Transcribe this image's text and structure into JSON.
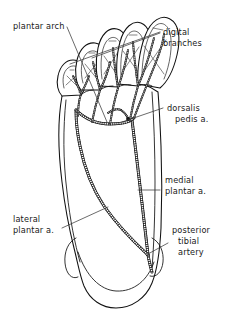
{
  "figure": {
    "view": "plantar view, right foot",
    "background_color": "#ffffff",
    "ink_color": "#111111",
    "label_color": "#1a1a1a",
    "leader_color": "#3a3a3a"
  },
  "labels": {
    "plantar_arch": "plantar arch",
    "digital_branches_line1": "digital",
    "digital_branches_line2": "branches",
    "dorsalis_pedis_line1": "dorsalis",
    "dorsalis_pedis_line2": "pedis a.",
    "medial_plantar_line1": "medial",
    "medial_plantar_line2": "plantar a.",
    "lateral_plantar_line1": "lateral",
    "lateral_plantar_line2": "plantar a.",
    "posterior_tibial_line1": "posterior",
    "posterior_tibial_line2": "tibial",
    "posterior_tibial_line3": "artery"
  },
  "structures": [
    {
      "name": "plantar-arch",
      "label": "plantar arch",
      "kind": "artery"
    },
    {
      "name": "digital-branches",
      "label": "digital branches",
      "kind": "artery"
    },
    {
      "name": "dorsalis-pedis-artery",
      "label": "dorsalis pedis a.",
      "kind": "artery"
    },
    {
      "name": "medial-plantar-artery",
      "label": "medial plantar a.",
      "kind": "artery"
    },
    {
      "name": "lateral-plantar-artery",
      "label": "lateral plantar a.",
      "kind": "artery"
    },
    {
      "name": "posterior-tibial-artery",
      "label": "posterior tibial artery",
      "kind": "artery"
    }
  ],
  "toes": [
    {
      "name": "toe-1-hallux",
      "position": "medial"
    },
    {
      "name": "toe-2",
      "position": "medial-central"
    },
    {
      "name": "toe-3",
      "position": "central"
    },
    {
      "name": "toe-4",
      "position": "lateral-central"
    },
    {
      "name": "toe-5-little",
      "position": "lateral"
    }
  ]
}
